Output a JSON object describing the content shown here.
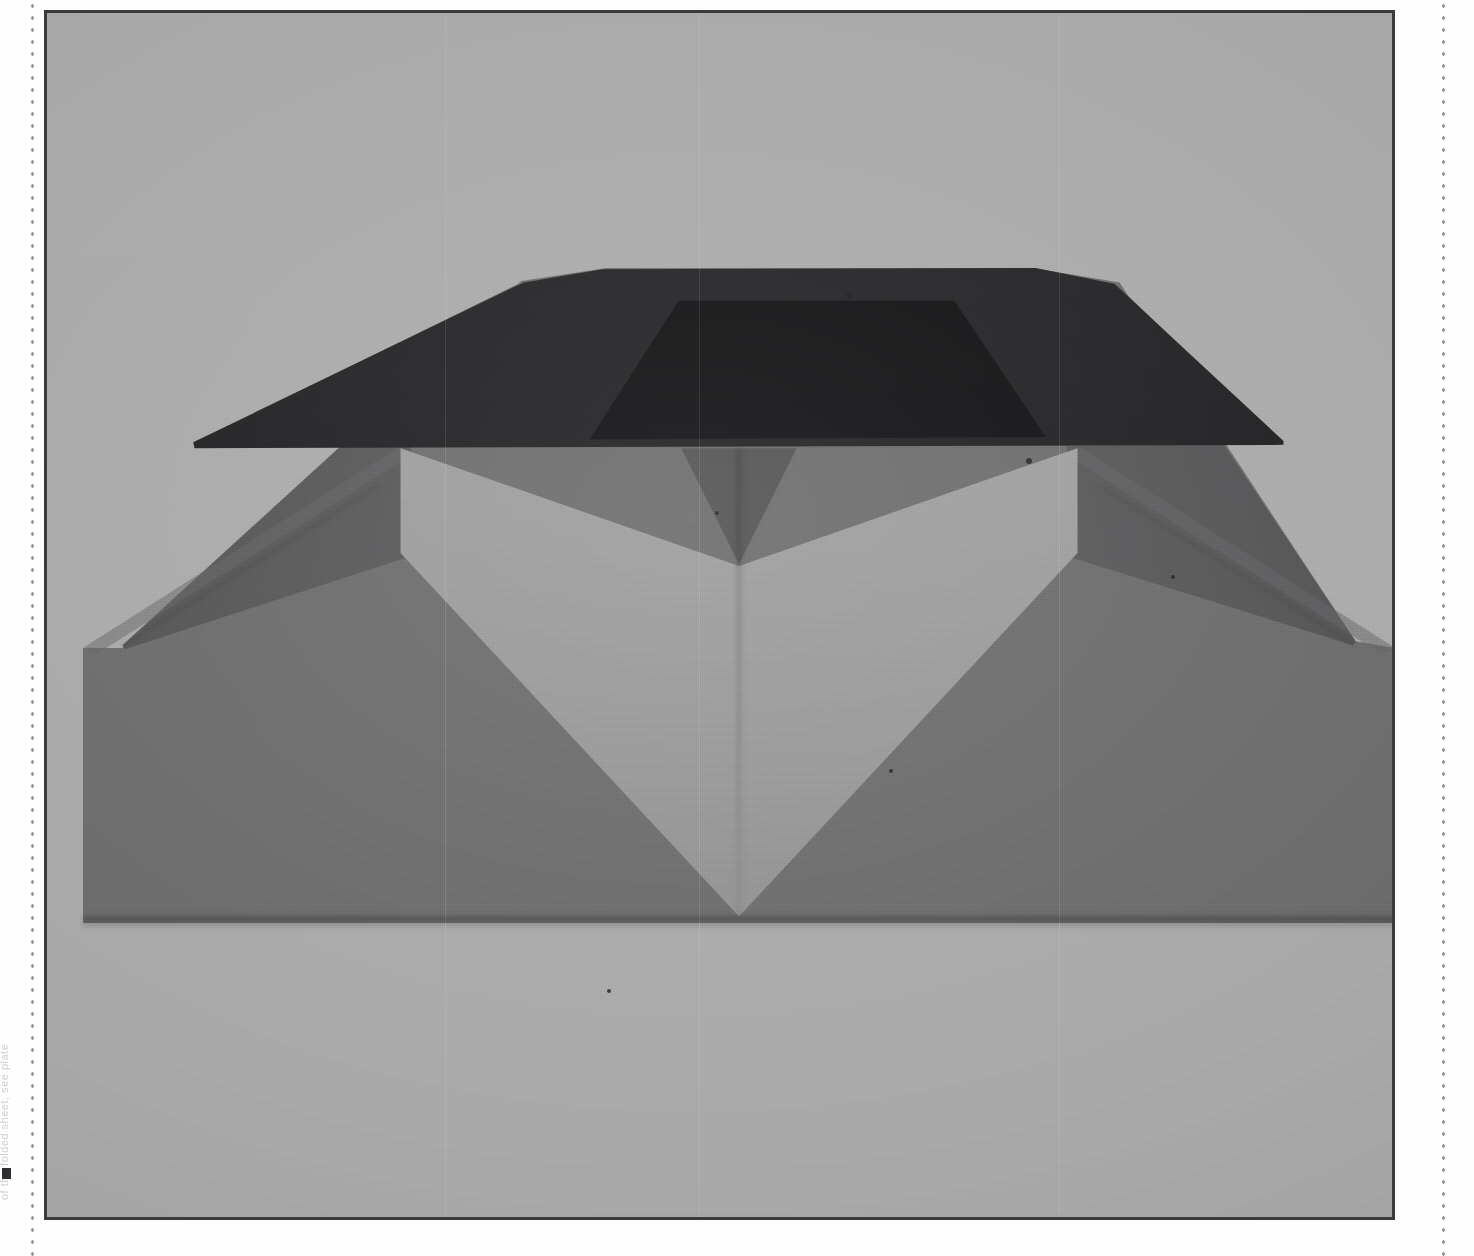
{
  "page": {
    "background_color": "#fefefe",
    "bleed_text": "of the folded sheet, see plate",
    "left_perforation": "dotted-cut-guide",
    "right_perforation": "dotted-cut-guide"
  },
  "plate": {
    "border_color": "#3a3a3e",
    "background_color": "#a9a9a9",
    "caption": "",
    "x": 44,
    "y": 10,
    "width": 1351,
    "height": 1210
  },
  "photo": {
    "subject": "folded paper envelope with heart fold",
    "medium": "grayscale photograph",
    "colors": {
      "backdrop": "#a9a9a9",
      "flap_dark": "#1c1c1f",
      "pocket_shadow": "#0e0e10",
      "body_mid": "#6b6b6b",
      "wing": "#5d5d5f",
      "heart_light": "#9d9d9d",
      "crease": "#000000"
    },
    "geometry": {
      "top_left_vertex": "487,269",
      "top_right_vertex": "1010,268",
      "left_shoulder": "81,632",
      "right_shoulder": "1408,628",
      "base_line_y": 910,
      "heart_bottom_point": "755,898"
    }
  },
  "specks": [
    {
      "x": 843,
      "y": 289,
      "r": 3
    },
    {
      "x": 1023,
      "y": 455,
      "r": 3
    },
    {
      "x": 1168,
      "y": 572,
      "r": 2
    },
    {
      "x": 712,
      "y": 508,
      "r": 2
    },
    {
      "x": 604,
      "y": 986,
      "r": 2
    },
    {
      "x": 886,
      "y": 766,
      "r": 2
    }
  ]
}
